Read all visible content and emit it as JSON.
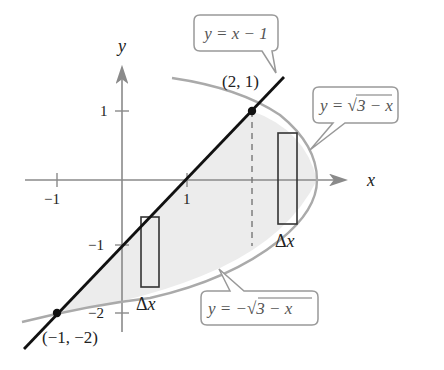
{
  "figure": {
    "axes": {
      "x_label": "x",
      "y_label": "y",
      "x_ticks": [
        {
          "value": -1,
          "label": "−1"
        },
        {
          "value": 1,
          "label": "1"
        }
      ],
      "y_ticks": [
        {
          "value": 1,
          "label": "1"
        },
        {
          "value": -1,
          "label": "−1"
        },
        {
          "value": -2,
          "label": "−2"
        }
      ]
    },
    "curves": {
      "line": {
        "label": "y = x − 1",
        "color": "#111111"
      },
      "upper": {
        "label_prefix": "y = ",
        "label_radicand": "3 − x",
        "full": "y = √(3 − x)",
        "color": "#aaaaaa"
      },
      "lower": {
        "label_prefix": "y = −",
        "label_radicand": "3 − x",
        "full": "y = −√(3 − x)",
        "color": "#aaaaaa"
      }
    },
    "points": [
      {
        "label": "(2, 1)",
        "x": 2,
        "y": 1
      },
      {
        "label": "(−1, −2)",
        "x": -1,
        "y": -2
      }
    ],
    "rectangles": [
      {
        "label": "Δx",
        "position": "left, between line and lower curve"
      },
      {
        "label": "Δx",
        "position": "right, between upper and lower curve"
      }
    ],
    "colors": {
      "region_fill": "#ececec",
      "axis": "#8a8a8a",
      "callout_border": "#999999"
    }
  }
}
